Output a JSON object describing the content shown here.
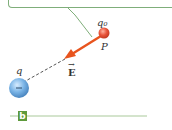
{
  "diagram": {
    "panel_label": "b",
    "callout_text": "",
    "test_charge": {
      "label": "q0",
      "label_display": "q₀",
      "sign": "+",
      "point_label": "P",
      "color": "#e8543a"
    },
    "source_charge": {
      "label": "q",
      "sign": "−",
      "color": "#5b9bd5"
    },
    "field_vector": {
      "label": "E",
      "direction": "toward source charge",
      "color": "#e8541e"
    },
    "connector": {
      "style": "dashed",
      "color": "#555555"
    },
    "accent_color": "#7fae7a"
  }
}
